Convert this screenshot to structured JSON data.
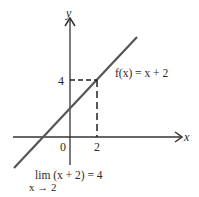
{
  "diagram": {
    "function_label": "f(x) = x + 2",
    "axes": {
      "x_label": "x",
      "y_label": "y"
    },
    "ticks": {
      "origin": "0",
      "x_tick": "2",
      "y_tick": "4"
    },
    "limit": {
      "expression": "lim (x + 2) = 4",
      "subscript": "x → 2"
    },
    "colors": {
      "line": "#555555",
      "axes": "#333333",
      "text": "#2a2a2a"
    }
  }
}
